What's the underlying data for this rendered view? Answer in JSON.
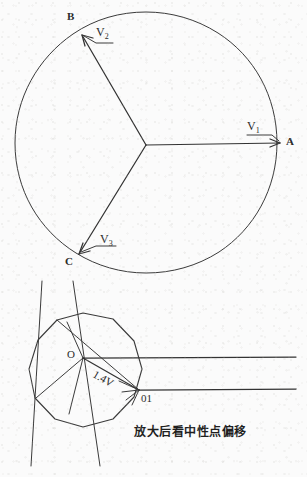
{
  "figure": {
    "title_caption": "放大后看中性点偏移",
    "ink_color": "#3a3a3a",
    "background_color": "#fbfbfb",
    "upper_diagram": {
      "name": "three-phase-phasor-circle",
      "circle": {
        "cx": 146,
        "cy": 143,
        "r": 131
      },
      "neutral_point": {
        "x": 146,
        "y": 145
      },
      "vertices": [
        {
          "label": "A",
          "x": 281,
          "y": 143,
          "label_x": 288,
          "label_y": 138
        },
        {
          "label": "B",
          "x": 82,
          "y": 34,
          "label_x": 70,
          "label_y": 12
        },
        {
          "label": "C",
          "x": 78,
          "y": 254,
          "label_x": 69,
          "label_y": 256
        }
      ],
      "phasors": [
        {
          "label": "V",
          "subscript": "1",
          "to_vertex": "A",
          "label_x": 250,
          "label_y": 122
        },
        {
          "label": "V",
          "subscript": "2",
          "to_vertex": "B",
          "label_x": 94,
          "label_y": 28
        },
        {
          "label": "V",
          "subscript": "3",
          "to_vertex": "C",
          "label_x": 99,
          "label_y": 235
        }
      ]
    },
    "lower_diagram": {
      "name": "neutral-point-shift-detail",
      "polygon_center": {
        "x": 83,
        "y": 372
      },
      "polygon_radius": 59,
      "polygon_sides": 11,
      "nodes": [
        {
          "label": "O",
          "x": 83,
          "y": 358,
          "label_x": 68,
          "label_y": 349
        },
        {
          "label": "01",
          "x": 139,
          "y": 390,
          "label_x": 142,
          "label_y": 394
        }
      ],
      "magnitude_annotation": {
        "text": "1.4V",
        "x": 97,
        "y": 372,
        "rotation_deg": 30
      },
      "horizontal_rays": [
        {
          "from_node": "O",
          "y": 358,
          "x_start": 83,
          "x_end": 296
        },
        {
          "from_node": "01",
          "y": 390,
          "x_start": 139,
          "x_end": 296
        }
      ]
    }
  }
}
